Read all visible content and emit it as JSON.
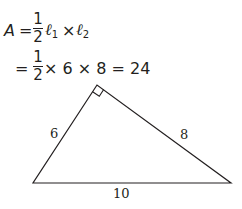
{
  "formula": {
    "line1": {
      "lhs": "A",
      "equals": "=",
      "frac_num": "1",
      "frac_den": "2",
      "l1_symbol": "ℓ",
      "l1_sub": "1",
      "times": "×",
      "l2_symbol": "ℓ",
      "l2_sub": "2"
    },
    "line2": {
      "equals": "=",
      "frac_num": "1",
      "frac_den": "2",
      "rest": "× 6 × 8 = 24"
    }
  },
  "triangle": {
    "type": "right triangle",
    "vertices": {
      "right_angle": [
        97,
        85
      ],
      "bottom_left": [
        33,
        183
      ],
      "bottom_right": [
        231,
        183
      ]
    },
    "labels": {
      "left_leg": "6",
      "right_leg": "8",
      "hypotenuse": "10"
    },
    "stroke_color": "#231f20"
  }
}
